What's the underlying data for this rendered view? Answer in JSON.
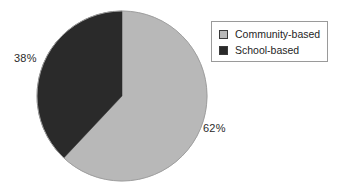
{
  "chart_data": {
    "type": "pie",
    "title": "",
    "categories": [
      "Community-based",
      "School-based"
    ],
    "values": [
      62,
      38
    ],
    "unit": "%",
    "data_labels": [
      "62%",
      "38%"
    ],
    "colors": [
      "#b8b8b8",
      "#2a2a2a"
    ],
    "start_angle_deg": 0,
    "direction": "clockwise",
    "legend_position": "right",
    "grid": false,
    "xlabel": "",
    "ylabel": ""
  },
  "figure": {
    "background_color": "#ffffff",
    "pie": {
      "center_x": 122,
      "center_y": 96,
      "radius": 85,
      "outline_color": "#9e9e9e",
      "slices": [
        {
          "name": "Community-based",
          "value": 62,
          "label": "62%",
          "color": "#b8b8b8"
        },
        {
          "name": "School-based",
          "value": 38,
          "label": "38%",
          "color": "#2a2a2a"
        }
      ]
    },
    "labels": {
      "left": "38%",
      "right": "62%",
      "text_color": "#2b2b2b"
    },
    "legend": {
      "border_color": "#9a9a9a",
      "background_color": "#ffffff",
      "items": [
        {
          "label": "Community-based",
          "swatch_color": "#b8b8b8",
          "swatch_border": "#3a3a3a"
        },
        {
          "label": "School-based",
          "swatch_color": "#2a2a2a",
          "swatch_border": "#3a3a3a"
        }
      ]
    }
  }
}
